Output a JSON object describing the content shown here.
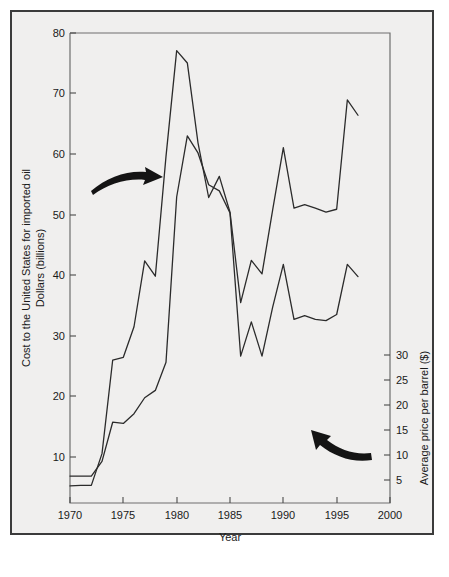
{
  "figure": {
    "background_color": "#f0efee",
    "border_color": "#3b3b3b",
    "line_color": "#2b2b2b"
  },
  "chart_data": {
    "type": "line",
    "title": "",
    "subtitle": "",
    "xlabel": "Year",
    "ylabel": "Cost to the United States for imported oil",
    "ylabel_line2": "Dollars (billions)",
    "y2label": "Average price per barrel ($)",
    "xlim": [
      1970,
      2000
    ],
    "ylim": [
      0,
      80
    ],
    "y2lim": [
      0,
      38.4
    ],
    "xticks": [
      1970,
      1975,
      1980,
      1985,
      1990,
      1995,
      2000
    ],
    "xticklabels": [
      "1970",
      "1975",
      "1980",
      "1985",
      "1990",
      "1995",
      "2000"
    ],
    "yticks": [
      10,
      20,
      30,
      40,
      50,
      60,
      70,
      80
    ],
    "yticklabels": [
      "10",
      "20",
      "30",
      "40",
      "50",
      "60",
      "70",
      "80"
    ],
    "y2ticks": [
      5,
      10,
      15,
      20,
      25,
      30
    ],
    "y2ticklabels": [
      "5",
      "10",
      "15",
      "20",
      "25",
      "30"
    ],
    "grid": false,
    "legend": "none",
    "x": [
      1970,
      1971,
      1972,
      1973,
      1974,
      1975,
      1976,
      1977,
      1978,
      1979,
      1980,
      1981,
      1982,
      1983,
      1984,
      1985,
      1986,
      1987,
      1988,
      1989,
      1990,
      1991,
      1992,
      1993,
      1994,
      1995,
      1996,
      1997
    ],
    "series": [
      {
        "name": "Cost to the United States for imported oil (billions of dollars)",
        "axis": "left",
        "units": "billions of dollars",
        "values": [
          2.9,
          3.0,
          3.0,
          8.4,
          24.3,
          24.8,
          30.0,
          41.2,
          38.6,
          59.0,
          77.0,
          74.9,
          61.3,
          52.0,
          55.6,
          49.5,
          34.1,
          41.3,
          39.0,
          49.9,
          60.5,
          50.2,
          50.8,
          50.2,
          49.5,
          50.0,
          68.6,
          66.0
        ]
      },
      {
        "name": "Average price per barrel ($)",
        "axis": "right",
        "units": "dollars per barrel",
        "values": [
          2.2,
          2.2,
          2.2,
          3.4,
          6.6,
          6.5,
          7.3,
          8.6,
          9.2,
          11.5,
          25.0,
          30.0,
          28.6,
          26.0,
          25.5,
          23.7,
          12.0,
          14.8,
          12.0,
          16.0,
          19.5,
          15.0,
          15.3,
          15.0,
          14.9,
          15.4,
          19.5,
          18.5
        ]
      }
    ],
    "annotations": [
      {
        "name": "arrow-to-cost-curve",
        "type": "curved-arrow",
        "direction": "right",
        "points_to": "Cost to the United States for imported oil"
      },
      {
        "name": "arrow-to-price-curve",
        "type": "curved-arrow",
        "direction": "upper-left",
        "points_to": "Average price per barrel ($)"
      }
    ]
  }
}
